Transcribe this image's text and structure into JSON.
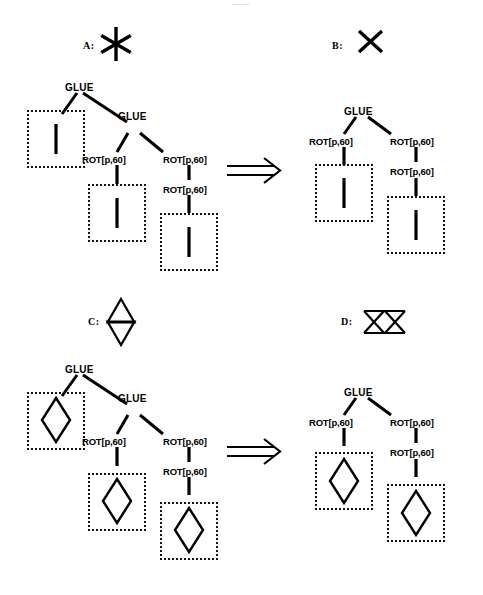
{
  "page": {
    "header_mark": "——",
    "background": "#ffffff",
    "ink": "#000000"
  },
  "figure": {
    "arrow_symbol": "⟹",
    "arrow_name": "double-arrow-derives",
    "panels": [
      {
        "id": "A",
        "caption": "A:",
        "shape_icon": "six-pointed-asterisk-icon",
        "role": "source-shape-top",
        "tile": "line-segment"
      },
      {
        "id": "B",
        "caption": "B:",
        "shape_icon": "x-cross-icon",
        "role": "result-shape-top",
        "tile": "line-segment"
      },
      {
        "id": "C",
        "caption": "C:",
        "shape_icon": "hexagram-star-of-david-icon",
        "role": "source-shape-bottom",
        "tile": "diamond"
      },
      {
        "id": "D",
        "caption": "D:",
        "shape_icon": "double-bowtie-icon",
        "role": "result-shape-bottom",
        "tile": "diamond"
      }
    ],
    "labels": {
      "glue": "GLUE",
      "rot": "ROT[p,60]"
    },
    "trees": {
      "top_left": {
        "name": "derivation-tree-A",
        "nodes": [
          {
            "id": "n1",
            "label": "GLUE"
          },
          {
            "id": "n2",
            "label": "GLUE"
          },
          {
            "id": "n3",
            "label": "ROT[p,60]"
          },
          {
            "id": "n4",
            "label": "ROT[p,60]"
          },
          {
            "id": "n5",
            "label": "ROT[p,60]"
          }
        ],
        "terminals": 3
      },
      "top_right": {
        "name": "derivation-tree-B",
        "nodes": [
          {
            "id": "m1",
            "label": "GLUE"
          },
          {
            "id": "m2",
            "label": "ROT[p,60]"
          },
          {
            "id": "m3",
            "label": "ROT[p,60]"
          },
          {
            "id": "m4",
            "label": "ROT[p,60]"
          }
        ],
        "terminals": 2
      },
      "bottom_left": {
        "name": "derivation-tree-C",
        "nodes": [
          {
            "id": "p1",
            "label": "GLUE"
          },
          {
            "id": "p2",
            "label": "GLUE"
          },
          {
            "id": "p3",
            "label": "ROT[p,60]"
          },
          {
            "id": "p4",
            "label": "ROT[p,60]"
          },
          {
            "id": "p5",
            "label": "ROT[p,60]"
          }
        ],
        "terminals": 3
      },
      "bottom_right": {
        "name": "derivation-tree-D",
        "nodes": [
          {
            "id": "q1",
            "label": "GLUE"
          },
          {
            "id": "q2",
            "label": "ROT[p,60]"
          },
          {
            "id": "q3",
            "label": "ROT[p,60]"
          },
          {
            "id": "q4",
            "label": "ROT[p,60]"
          }
        ],
        "terminals": 2
      }
    }
  }
}
